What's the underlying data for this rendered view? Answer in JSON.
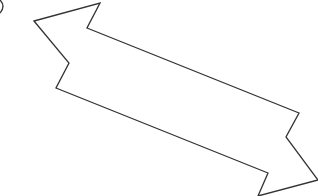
{
  "diagram": {
    "type": "double-headed-arrow",
    "stroke_color": "#333333",
    "fill_color": "#ffffff",
    "background": "#ffffff",
    "arrow_points": "34,21 100,3 87,28 299,113 286,137 318,180 258,196 268,173 56,88 69,63",
    "fragment_path": "M0,0 Q6,6 0,13"
  }
}
